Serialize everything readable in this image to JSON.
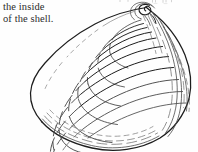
{
  "page": {
    "width": 198,
    "height": 152,
    "background_color": "#fefefe",
    "ink_color": "#1d1d1d"
  },
  "caption": {
    "lines": [
      "the inside",
      "of the shell."
    ],
    "line_1": "the inside",
    "line_2": "of the shell.",
    "text_color": "#2b2b2b"
  },
  "figure": {
    "style": "ink line drawing",
    "parts": {
      "umbo": "umbo-spiral",
      "growth_rings": "concentric-growth-rings",
      "margin": "ventral-margin",
      "flank": "posterior-flank-lines"
    }
  }
}
